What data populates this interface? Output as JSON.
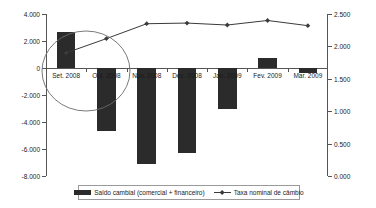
{
  "chart_data": {
    "type": "bar",
    "title": "",
    "subtitle": "",
    "xlabel": "",
    "ylabel": "",
    "categories": [
      "Set. 2008",
      "Out. 2008",
      "Nov. 2008",
      "Dez. 2008",
      "Jan. 2009",
      "Fev. 2009",
      "Mar. 2009"
    ],
    "series": [
      {
        "name": "Saldo cambial (comercial + financeiro)",
        "type": "bar",
        "axis": "left",
        "color": "#2b2b2b",
        "values": [
          2700,
          -4650,
          -7100,
          -6300,
          -3000,
          750,
          -400
        ]
      },
      {
        "name": "Taxa nominal de câmbio",
        "type": "line",
        "axis": "right",
        "color": "#3a3a3a",
        "marker": "diamond",
        "values": [
          1.9,
          2.12,
          2.35,
          2.36,
          2.33,
          2.4,
          2.32
        ]
      }
    ],
    "left_axis": {
      "ticks": [
        "4.000",
        "2.000",
        "0",
        "-2.000",
        "-4.000",
        "-6.000",
        "-8.000"
      ],
      "values": [
        4000,
        2000,
        0,
        -2000,
        -4000,
        -6000,
        -8000
      ],
      "ylim": [
        -8000,
        4000
      ]
    },
    "right_axis": {
      "ticks": [
        "2.500",
        "2.000",
        "1.500",
        "1.000",
        "0.500",
        "0.000"
      ],
      "values": [
        2.5,
        2.0,
        1.5,
        1.0,
        0.5,
        0.0
      ],
      "ylim": [
        0.0,
        2.5
      ]
    },
    "grid": false,
    "legend_position": "bottom",
    "annotations": [
      {
        "name": "highlight-ellipse",
        "shape": "ellipse",
        "cx_category_index": 0.85,
        "cy_value": 0,
        "note": ""
      }
    ]
  },
  "legend": {
    "entries": [
      {
        "label": "Saldo cambial (comercial + financeiro)",
        "icon": "bar-swatch-icon"
      },
      {
        "label": "Taxa nominal de câmbio",
        "icon": "line-marker-swatch-icon"
      }
    ]
  }
}
